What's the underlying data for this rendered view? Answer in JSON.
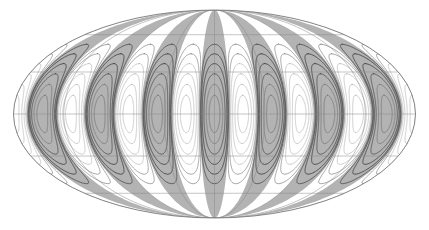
{
  "figure": {
    "title": "",
    "projection": "Mollweide",
    "width": 429,
    "height": 230,
    "background": "#ffffff"
  },
  "colors": {
    "background": "#ffffff",
    "fill_positive": "#b3b3b3",
    "fill_positive_soft": "#c9c9c9",
    "fill_negative": "#ffffff",
    "contour_dark": "#4a4a4a",
    "contour_mid": "#7a7a7a",
    "contour_light": "#b5b5b5",
    "graticule": "#8a8a8a",
    "outline": "#6e6e6e"
  },
  "chart_data": {
    "type": "contour",
    "title": "",
    "subtitle": "",
    "xlabel": "",
    "ylabel": "",
    "projection": "Mollweide",
    "function": "sectoral spherical harmonic",
    "degree_l": 7,
    "order_m": 7,
    "lobe_count_total": 14,
    "lobe_count_positive": 7,
    "lobe_count_negative": 7,
    "longitude_range_deg": [
      -180,
      180
    ],
    "latitude_range_deg": [
      -90,
      90
    ],
    "grid": true,
    "legend": "none",
    "ellipse": {
      "center_x": 214.5,
      "center_y": 114,
      "semi_major_x": 201,
      "semi_minor_y": 104
    },
    "graticule": {
      "latitude_ticks_deg": [
        -60,
        -30,
        0,
        30,
        60
      ],
      "longitude_ticks_deg": [
        -180,
        -135,
        -90,
        -45,
        0,
        45,
        90,
        135,
        180
      ],
      "latitude_step_deg": 30,
      "longitude_step_deg": 45
    },
    "contour_levels": [
      -0.9,
      -0.7,
      -0.5,
      -0.3,
      -0.1,
      0.1,
      0.3,
      0.5,
      0.7,
      0.9
    ],
    "contour_rings_per_lobe": 5,
    "value_range": [
      -1,
      1
    ],
    "positive_lobe_centers_deg_longitude": [
      -180,
      -128.6,
      -77.1,
      -25.7,
      25.7,
      77.1,
      128.6
    ],
    "negative_lobe_centers_deg_longitude": [
      -154.3,
      -102.9,
      -51.4,
      0,
      51.4,
      102.9,
      154.3
    ],
    "positive_lobe_centers_px_x": [
      14,
      40,
      91,
      146,
      214,
      283,
      338,
      389,
      415
    ],
    "shading": "positive lobes filled gray, negative lobes white"
  }
}
